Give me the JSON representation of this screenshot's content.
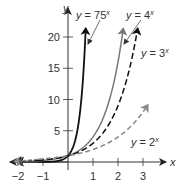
{
  "chart_data": {
    "type": "line",
    "title": "",
    "xlabel": "x",
    "ylabel": "y",
    "xlim": [
      -2.5,
      4.2
    ],
    "ylim": [
      -0.5,
      22
    ],
    "grid": false,
    "legend_position": "inline-annotations",
    "x_ticks": [
      -2,
      -1,
      1,
      2,
      3
    ],
    "x_tick_labels": [
      "−2",
      "−1",
      "1",
      "2",
      "3"
    ],
    "y_ticks": [
      5,
      10,
      15,
      20
    ],
    "y_tick_labels": [
      "5",
      "10",
      "15",
      "20"
    ],
    "series": [
      {
        "name": "y = 75^x",
        "base": 75,
        "style": "solid",
        "color": "#111111",
        "label_text": "y = 75",
        "label_exp": "x",
        "x_end": 0.71,
        "values_sample": {
          "x": [
            -2,
            -1,
            0,
            0.5,
            0.71
          ],
          "y": [
            0.0002,
            0.0133,
            1,
            8.66,
            21.4
          ]
        }
      },
      {
        "name": "y = 4^x",
        "base": 4,
        "style": "solid",
        "color": "#777777",
        "label_text": "y = 4",
        "label_exp": "x",
        "x_end": 2.21,
        "values_sample": {
          "x": [
            -2,
            -1,
            0,
            1,
            2,
            2.21
          ],
          "y": [
            0.0625,
            0.25,
            1,
            4,
            16,
            21.4
          ]
        }
      },
      {
        "name": "y = 3^x",
        "base": 3,
        "style": "dashed",
        "color": "#111111",
        "label_text": "y = 3",
        "label_exp": "x",
        "x_end": 2.79,
        "values_sample": {
          "x": [
            -2,
            -1,
            0,
            1,
            2,
            2.79
          ],
          "y": [
            0.111,
            0.333,
            1,
            3,
            9,
            21.4
          ]
        }
      },
      {
        "name": "y = 2^x",
        "base": 2,
        "style": "dashed",
        "color": "#888888",
        "label_text": "y = 2",
        "label_exp": "x",
        "x_end": 3.2,
        "values_sample": {
          "x": [
            -2,
            -1,
            0,
            1,
            2,
            3,
            3.2
          ],
          "y": [
            0.25,
            0.5,
            1,
            2,
            4,
            8,
            9.19
          ]
        }
      }
    ]
  },
  "axes": {
    "x_label": "x",
    "y_label": "y"
  },
  "colors": {
    "axis": "#333333",
    "solid_dark": "#111111",
    "solid_gray": "#777777",
    "dashed_dark": "#111111",
    "dashed_gray": "#888888"
  }
}
